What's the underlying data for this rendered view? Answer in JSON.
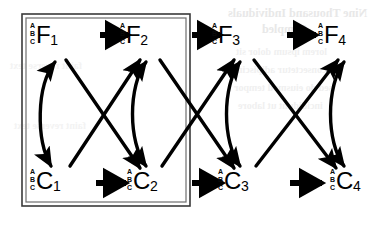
{
  "diagram": {
    "type": "directed-graph",
    "background_color": "#ffffff",
    "stroke_color": "#000000",
    "box": {
      "style": "double-line",
      "label": "enclosing-box",
      "x": 22,
      "y": 14,
      "width": 168,
      "height": 192
    },
    "prefix_labels": [
      "A",
      "B",
      "C"
    ],
    "rows": [
      {
        "name": "top-row",
        "nodes": [
          {
            "id": "F1",
            "letter": "F",
            "index": "1",
            "prefix": [
              "A",
              "B",
              "C"
            ],
            "x": 30,
            "y": 22
          },
          {
            "id": "F2",
            "letter": "F",
            "index": "2",
            "prefix": [
              "A",
              "B",
              "C"
            ],
            "x": 120,
            "y": 22
          },
          {
            "id": "F3",
            "letter": "F",
            "index": "3",
            "prefix": [
              "A",
              "B",
              "C"
            ],
            "x": 212,
            "y": 22
          },
          {
            "id": "F4",
            "letter": "F",
            "index": "4",
            "prefix": [
              "A",
              "B",
              "C"
            ],
            "x": 318,
            "y": 22
          }
        ]
      },
      {
        "name": "bottom-row",
        "nodes": [
          {
            "id": "C1",
            "letter": "C",
            "index": "1",
            "prefix": [
              "A",
              "B",
              "C"
            ],
            "x": 30,
            "y": 168
          },
          {
            "id": "C2",
            "letter": "C",
            "index": "2",
            "prefix": [
              "A",
              "B",
              "C"
            ],
            "x": 127,
            "y": 168
          },
          {
            "id": "C3",
            "letter": "C",
            "index": "3",
            "prefix": [
              "A",
              "B",
              "C"
            ],
            "x": 218,
            "y": 168
          },
          {
            "id": "C4",
            "letter": "C",
            "index": "4",
            "prefix": [
              "A",
              "B",
              "C"
            ],
            "x": 330,
            "y": 168
          }
        ]
      }
    ],
    "edges": [
      {
        "from": "F1",
        "to": "F2",
        "kind": "horizontal",
        "direction": "one-way"
      },
      {
        "from": "F2",
        "to": "F3",
        "kind": "horizontal",
        "direction": "one-way"
      },
      {
        "from": "F3",
        "to": "F4",
        "kind": "horizontal",
        "direction": "one-way"
      },
      {
        "from": "C1",
        "to": "C2",
        "kind": "horizontal",
        "direction": "one-way"
      },
      {
        "from": "C2",
        "to": "C3",
        "kind": "horizontal",
        "direction": "one-way"
      },
      {
        "from": "C3",
        "to": "C4",
        "kind": "horizontal",
        "direction": "one-way"
      },
      {
        "from": "F1",
        "to": "C1",
        "kind": "curved-arc",
        "direction": "bidirectional"
      },
      {
        "from": "F2",
        "to": "C2",
        "kind": "curved-arc",
        "direction": "bidirectional"
      },
      {
        "from": "F3",
        "to": "C3",
        "kind": "curved-arc",
        "direction": "bidirectional"
      },
      {
        "from": "F4",
        "to": "C4",
        "kind": "curved-arc",
        "direction": "bidirectional"
      },
      {
        "from": "F1",
        "to": "C2",
        "kind": "diagonal",
        "direction": "one-way"
      },
      {
        "from": "C1",
        "to": "F2",
        "kind": "diagonal",
        "direction": "one-way"
      },
      {
        "from": "F2",
        "to": "C3",
        "kind": "diagonal",
        "direction": "one-way"
      },
      {
        "from": "C2",
        "to": "F3",
        "kind": "diagonal",
        "direction": "one-way"
      },
      {
        "from": "F3",
        "to": "C4",
        "kind": "diagonal",
        "direction": "one-way"
      },
      {
        "from": "C3",
        "to": "F4",
        "kind": "diagonal",
        "direction": "one-way"
      }
    ]
  },
  "page_bleed": {
    "title": "Nine Thousand Individuals",
    "subtitle": "Sampled",
    "body1": "lorem ipsum dolor sit",
    "body2": "consectetur adipiscing",
    "body3": "sed do eiusmod tempor",
    "body4": "incididunt ut labore",
    "left1": "faint reverse text",
    "left2": "faint reverse text"
  }
}
